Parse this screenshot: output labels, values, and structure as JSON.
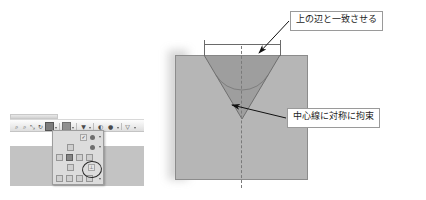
{
  "document": {
    "title_fragment": "",
    "description": "CAD sketch annotation diagram with V-groove part and Japanese callouts"
  },
  "app_capture": {
    "titlebar_text": "",
    "toolbar": {
      "icons": [
        {
          "name": "zoom-in-icon",
          "glyph": "⌕"
        },
        {
          "name": "zoom-out-icon",
          "glyph": "⌕"
        },
        {
          "name": "pan-icon",
          "glyph": "⤡"
        },
        {
          "name": "rotate-icon",
          "glyph": "↻"
        },
        {
          "name": "constraint-icon",
          "glyph": "⊥"
        },
        {
          "name": "display-style-icon",
          "glyph": "▣"
        },
        {
          "name": "view-orientation-icon",
          "glyph": "▼"
        },
        {
          "name": "shadow-icon",
          "glyph": "◐"
        },
        {
          "name": "appearance-icon",
          "glyph": "●"
        },
        {
          "name": "section-view-icon",
          "glyph": "▽"
        }
      ]
    },
    "constraint_panel": {
      "label": "",
      "selected_tool": "symmetric-constraint",
      "rows": [
        [
          "auto-constraint-icon",
          "coincident-icon",
          "collinear-icon"
        ],
        [
          "concentric-icon",
          "fix-icon",
          "parallel-icon"
        ],
        [
          "perpendicular-icon",
          "horizontal-icon",
          "vertical-icon",
          "tangent-icon"
        ],
        [
          "smooth-icon",
          "symmetric-icon",
          "equal-icon"
        ],
        [
          "dimension-icon",
          "linear-dim-icon",
          "angular-dim-icon",
          "radial-dim-icon",
          "diameter-dim-icon"
        ]
      ]
    },
    "highlight": {
      "name": "hand-drawn-ellipse",
      "target": "symmetric-constraint-button"
    }
  },
  "sketch": {
    "part_name": "v-groove-part",
    "dimension_top": {
      "name": "width-dimension",
      "value": ""
    },
    "angle_dimension": {
      "name": "groove-angle-dimension",
      "value": ""
    },
    "centerline_label": "centerline",
    "colors": {
      "body_fill": "#b6b6b6",
      "groove_fill": "#9e9e9e",
      "outline": "#8c8c8c",
      "leader": "#1a1a1a",
      "callout_border": "#9a9a9a"
    }
  },
  "callouts": [
    {
      "name": "callout-match-top-edge",
      "text": "上の辺と一致させる",
      "points_to": "groove-top-edge"
    },
    {
      "name": "callout-symmetric-constraint",
      "text": "中心線に対称に拘束",
      "points_to": "centerline"
    }
  ]
}
